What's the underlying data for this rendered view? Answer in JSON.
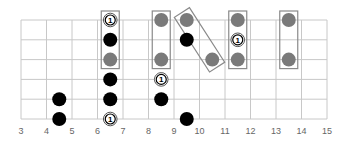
{
  "diagram": {
    "fret_range": [
      3,
      15
    ],
    "strings": 6,
    "fret_labels": [
      "3",
      "4",
      "5",
      "6",
      "7",
      "8",
      "9",
      "10",
      "11",
      "12",
      "13",
      "14",
      "15"
    ],
    "colors": {
      "black": "#000000",
      "gray": "#7a7a7a",
      "root_fill": "#ffffff",
      "box": "#8a8a8a",
      "grid": "#c8c8c8"
    },
    "dots": [
      {
        "fret": 4.5,
        "string": 5,
        "type": "black"
      },
      {
        "fret": 4.5,
        "string": 6,
        "type": "black"
      },
      {
        "fret": 6.5,
        "string": 1,
        "type": "root",
        "label": "1"
      },
      {
        "fret": 6.5,
        "string": 2,
        "type": "black"
      },
      {
        "fret": 6.5,
        "string": 3,
        "type": "gray"
      },
      {
        "fret": 6.5,
        "string": 4,
        "type": "black"
      },
      {
        "fret": 6.5,
        "string": 5,
        "type": "black"
      },
      {
        "fret": 6.5,
        "string": 6,
        "type": "root",
        "label": "1"
      },
      {
        "fret": 8.5,
        "string": 1,
        "type": "gray"
      },
      {
        "fret": 8.5,
        "string": 3,
        "type": "gray"
      },
      {
        "fret": 8.5,
        "string": 4,
        "type": "root",
        "label": "1"
      },
      {
        "fret": 8.5,
        "string": 5,
        "type": "black"
      },
      {
        "fret": 9.5,
        "string": 1,
        "type": "gray"
      },
      {
        "fret": 9.5,
        "string": 2,
        "type": "black"
      },
      {
        "fret": 9.5,
        "string": 6,
        "type": "black"
      },
      {
        "fret": 10.5,
        "string": 3,
        "type": "gray"
      },
      {
        "fret": 11.5,
        "string": 1,
        "type": "gray"
      },
      {
        "fret": 11.5,
        "string": 2,
        "type": "root",
        "label": "1"
      },
      {
        "fret": 11.5,
        "string": 3,
        "type": "gray"
      },
      {
        "fret": 13.5,
        "string": 1,
        "type": "gray"
      },
      {
        "fret": 13.5,
        "string": 3,
        "type": "gray"
      }
    ],
    "boxes": [
      {
        "from": {
          "fret": 6.5,
          "string": 1
        },
        "to": {
          "fret": 6.5,
          "string": 3
        }
      },
      {
        "from": {
          "fret": 8.5,
          "string": 1
        },
        "to": {
          "fret": 8.5,
          "string": 3
        }
      },
      {
        "from": {
          "fret": 9.5,
          "string": 1
        },
        "to": {
          "fret": 10.5,
          "string": 3
        }
      },
      {
        "from": {
          "fret": 11.5,
          "string": 1
        },
        "to": {
          "fret": 11.5,
          "string": 3
        }
      },
      {
        "from": {
          "fret": 13.5,
          "string": 1
        },
        "to": {
          "fret": 13.5,
          "string": 3
        }
      }
    ]
  }
}
